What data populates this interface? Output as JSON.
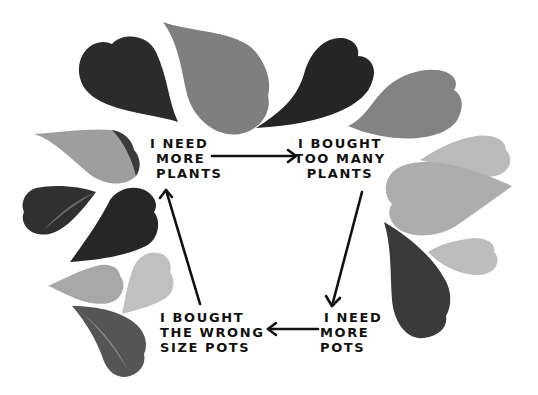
{
  "diagram": {
    "type": "cycle",
    "colors": {
      "background": "#ffffff",
      "ink": "#111111",
      "leaf_dark": "#2a2a2a",
      "leaf_mid": "#7d7d7d",
      "leaf_light": "#aaaaaa",
      "leaf_pale": "#bdbdbd"
    },
    "nodes": [
      {
        "id": "need-plants",
        "lines": [
          "I NEED",
          "MORE",
          "PLANTS"
        ]
      },
      {
        "id": "too-many-plants",
        "lines": [
          "I BOUGHT",
          "TOO MANY",
          "PLANTS"
        ]
      },
      {
        "id": "need-pots",
        "lines": [
          "I NEED",
          "MORE",
          "POTS"
        ]
      },
      {
        "id": "wrong-pots",
        "lines": [
          "I BOUGHT",
          "THE WRONG",
          "SIZE POTS"
        ]
      }
    ],
    "edges": [
      {
        "from": "need-plants",
        "to": "too-many-plants"
      },
      {
        "from": "too-many-plants",
        "to": "need-pots"
      },
      {
        "from": "need-pots",
        "to": "wrong-pots"
      },
      {
        "from": "wrong-pots",
        "to": "need-plants"
      }
    ]
  }
}
